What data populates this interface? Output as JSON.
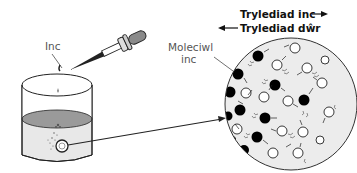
{
  "labels": {
    "ink": "Inc",
    "ink_molecule_line1": "Moleciwl",
    "ink_molecule_line2": "inc",
    "ink_diffusion": "Tryledіad inc",
    "water_diffusion": "Trylediad dŵr"
  },
  "legend": {
    "ink_diffusion_direction": "right",
    "water_diffusion_direction": "left"
  },
  "components": [
    "dropper",
    "beaker",
    "ink-drop",
    "magnified-view-circle",
    "ink-molecules",
    "water-molecules"
  ],
  "colors": {
    "outline": "#222222",
    "liquid_surface": "#9a9a9a",
    "liquid": "#e6e6e6",
    "magnified_bg": "#ececec",
    "ink_molecule": "#000000",
    "water_molecule": "#ffffff",
    "dropper_bulb": "#8a8a8a"
  }
}
